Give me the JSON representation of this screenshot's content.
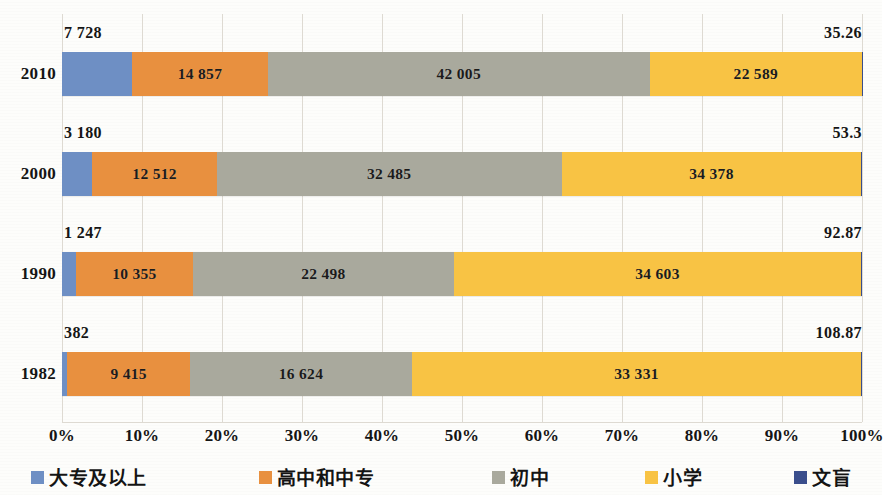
{
  "chart_data": {
    "type": "bar",
    "subtype": "100% stacked horizontal bar",
    "title": "",
    "xlabel": "",
    "ylabel": "",
    "xlim": [
      0,
      100
    ],
    "grid": true,
    "legend_position": "bottom",
    "categories": [
      "2010",
      "2000",
      "1990",
      "1982"
    ],
    "x_tick_labels": [
      "0%",
      "10%",
      "20%",
      "30%",
      "40%",
      "50%",
      "60%",
      "70%",
      "80%",
      "90%",
      "100%"
    ],
    "x_tick_values": [
      0,
      10,
      20,
      30,
      40,
      50,
      60,
      70,
      80,
      90,
      100
    ],
    "series": [
      {
        "name": "大专及以上",
        "color": "#6E8FC4",
        "values": [
          7728,
          3180,
          1247,
          382
        ],
        "percents": [
          8.8,
          3.8,
          1.8,
          0.7
        ]
      },
      {
        "name": "高中和中专",
        "color": "#E8903F",
        "values": [
          14857,
          12512,
          10355,
          9415
        ],
        "percents": [
          16.9,
          15.4,
          14.6,
          16.0
        ]
      },
      {
        "name": "初中",
        "color": "#A9A99D",
        "values": [
          42005,
          32485,
          22498,
          16624
        ],
        "percents": [
          47.8,
          40.0,
          32.6,
          28.2
        ]
      },
      {
        "name": "小学",
        "color": "#F8C344",
        "values": [
          22589,
          34378,
          34603,
          33331
        ],
        "percents": [
          26.5,
          40.7,
          50.9,
          55.0
        ]
      },
      {
        "name": "文盲",
        "color": "#3A4E8C",
        "values": [
          35.26,
          53.3,
          92.87,
          108.87
        ],
        "percents": [
          0.04,
          0.07,
          0.12,
          0.14
        ]
      }
    ],
    "bar_segment_labels": [
      [
        "7 728",
        "14 857",
        "42 005",
        "22 589",
        "35.26"
      ],
      [
        "3 180",
        "12 512",
        "32 485",
        "34 378",
        "53.3"
      ],
      [
        "1 247",
        "10 355",
        "22 498",
        "34 603",
        "92.87"
      ],
      [
        "382",
        "9 415",
        "16 624",
        "33 331",
        "108.87"
      ]
    ],
    "rows": [
      {
        "category": "2010",
        "left_caption": "7 728",
        "right_caption": "35.26",
        "segments": [
          {
            "series": "大专及以上",
            "label": "7 728",
            "pct": 8.8,
            "show_label": false,
            "color": "#6E8FC4"
          },
          {
            "series": "高中和中专",
            "label": "14 857",
            "pct": 16.9,
            "show_label": true,
            "color": "#E8903F"
          },
          {
            "series": "初中",
            "label": "42 005",
            "pct": 47.8,
            "show_label": true,
            "color": "#A9A99D"
          },
          {
            "series": "小学",
            "label": "22 589",
            "pct": 26.46,
            "show_label": true,
            "color": "#F8C344"
          },
          {
            "series": "文盲",
            "label": "35.26",
            "pct": 0.04,
            "show_label": false,
            "color": "#3A4E8C"
          }
        ]
      },
      {
        "category": "2000",
        "left_caption": "3 180",
        "right_caption": "53.3",
        "segments": [
          {
            "series": "大专及以上",
            "label": "3 180",
            "pct": 3.8,
            "show_label": false,
            "color": "#6E8FC4"
          },
          {
            "series": "高中和中专",
            "label": "12 512",
            "pct": 15.55,
            "show_label": true,
            "color": "#E8903F"
          },
          {
            "series": "初中",
            "label": "32 485",
            "pct": 43.1,
            "show_label": true,
            "color": "#A9A99D"
          },
          {
            "series": "小学",
            "label": "34 378",
            "pct": 37.48,
            "show_label": true,
            "color": "#F8C344"
          },
          {
            "series": "文盲",
            "label": "53.3",
            "pct": 0.07,
            "show_label": false,
            "color": "#3A4E8C"
          }
        ]
      },
      {
        "category": "1990",
        "left_caption": "1 247",
        "right_caption": "92.87",
        "segments": [
          {
            "series": "大专及以上",
            "label": "1 247",
            "pct": 1.75,
            "show_label": false,
            "color": "#6E8FC4"
          },
          {
            "series": "高中和中专",
            "label": "10 355",
            "pct": 14.6,
            "show_label": true,
            "color": "#E8903F"
          },
          {
            "series": "初中",
            "label": "22 498",
            "pct": 32.65,
            "show_label": true,
            "color": "#A9A99D"
          },
          {
            "series": "小学",
            "label": "34 603",
            "pct": 50.88,
            "show_label": true,
            "color": "#F8C344"
          },
          {
            "series": "文盲",
            "label": "92.87",
            "pct": 0.12,
            "show_label": false,
            "color": "#3A4E8C"
          }
        ]
      },
      {
        "category": "1982",
        "left_caption": "382",
        "right_caption": "108.87",
        "segments": [
          {
            "series": "大专及以上",
            "label": "382",
            "pct": 0.68,
            "show_label": false,
            "color": "#6E8FC4"
          },
          {
            "series": "高中和中专",
            "label": "9 415",
            "pct": 15.3,
            "show_label": true,
            "color": "#E8903F"
          },
          {
            "series": "初中",
            "label": "16 624",
            "pct": 27.8,
            "show_label": true,
            "color": "#A9A99D"
          },
          {
            "series": "小学",
            "label": "33 331",
            "pct": 56.08,
            "show_label": true,
            "color": "#F8C344"
          },
          {
            "series": "文盲",
            "label": "108.87",
            "pct": 0.14,
            "show_label": false,
            "color": "#3A4E8C"
          }
        ]
      }
    ],
    "legend": [
      {
        "label": "大专及以上",
        "color": "#6E8FC4"
      },
      {
        "label": "高中和中专",
        "color": "#E8903F"
      },
      {
        "label": "初中",
        "color": "#A9A99D"
      },
      {
        "label": "小学",
        "color": "#F8C344"
      },
      {
        "label": "文盲",
        "color": "#3A4E8C"
      }
    ]
  }
}
